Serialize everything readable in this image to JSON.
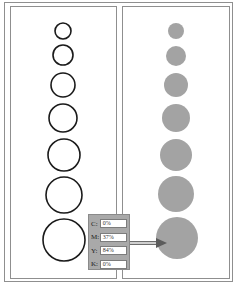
{
  "figure": {
    "left_panel": {
      "style": "outline",
      "stroke_color": "#1a1a1a",
      "circles": [
        {
          "cx": 63,
          "cy": 31,
          "r": 8
        },
        {
          "cx": 63,
          "cy": 55,
          "r": 10
        },
        {
          "cx": 63,
          "cy": 85,
          "r": 12
        },
        {
          "cx": 63,
          "cy": 118,
          "r": 14
        },
        {
          "cx": 64,
          "cy": 155,
          "r": 16
        },
        {
          "cx": 64,
          "cy": 195,
          "r": 18
        },
        {
          "cx": 64,
          "cy": 240,
          "r": 21
        }
      ]
    },
    "right_panel": {
      "style": "filled",
      "fill_color": "#a3a3a3",
      "circles": [
        {
          "cx": 176,
          "cy": 31,
          "r": 8
        },
        {
          "cx": 176,
          "cy": 56,
          "r": 10
        },
        {
          "cx": 176,
          "cy": 85,
          "r": 12
        },
        {
          "cx": 176,
          "cy": 118,
          "r": 14
        },
        {
          "cx": 176,
          "cy": 155,
          "r": 16
        },
        {
          "cx": 176,
          "cy": 194,
          "r": 18
        },
        {
          "cx": 177,
          "cy": 238,
          "r": 21
        }
      ]
    },
    "color_panel": {
      "rows": [
        {
          "label": "C:",
          "value": "0%"
        },
        {
          "label": "M:",
          "value": "37%"
        },
        {
          "label": "Y:",
          "value": "84%"
        },
        {
          "label": "K:",
          "value": "0%"
        }
      ]
    },
    "arrow": {
      "from_x": 130,
      "to_x": 166,
      "y": 243
    }
  }
}
